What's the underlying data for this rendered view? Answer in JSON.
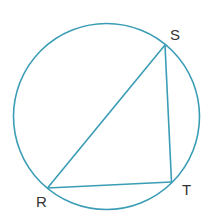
{
  "diagram": {
    "type": "inscribed-triangle",
    "stroke_color": "#3a9db5",
    "label_color": "#333333",
    "circle": {
      "cx": 106.5,
      "cy": 116.5,
      "r": 93
    },
    "points": {
      "S": {
        "x": 165,
        "y": 45
      },
      "T": {
        "x": 171.5,
        "y": 182
      },
      "R": {
        "x": 47.5,
        "y": 188
      }
    },
    "labels": {
      "S": "S",
      "T": "T",
      "R": "R"
    }
  }
}
